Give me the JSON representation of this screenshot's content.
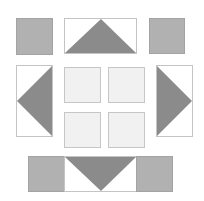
{
  "diagram": {
    "title": "",
    "colors": {
      "background": "#ffffff",
      "gray_square": "#b1b1b1",
      "triangle": "#8b8b8b",
      "light_square": "#f1f1f1",
      "border": "#c4c4c4"
    },
    "pieces": [
      {
        "id": "top-left-square",
        "type": "square",
        "fill": "gray"
      },
      {
        "id": "top-center-triangle-block",
        "type": "triangle-rect",
        "direction": "up"
      },
      {
        "id": "top-right-square",
        "type": "square",
        "fill": "gray"
      },
      {
        "id": "left-triangle-block",
        "type": "triangle-rect",
        "direction": "left"
      },
      {
        "id": "center-square-1",
        "type": "square",
        "fill": "light"
      },
      {
        "id": "center-square-2",
        "type": "square",
        "fill": "light"
      },
      {
        "id": "center-square-3",
        "type": "square",
        "fill": "light"
      },
      {
        "id": "center-square-4",
        "type": "square",
        "fill": "light"
      },
      {
        "id": "right-triangle-block",
        "type": "triangle-rect",
        "direction": "right"
      },
      {
        "id": "bottom-left-square",
        "type": "square",
        "fill": "gray"
      },
      {
        "id": "bottom-center-triangle-block",
        "type": "triangle-rect",
        "direction": "down"
      },
      {
        "id": "bottom-right-square",
        "type": "square",
        "fill": "gray"
      }
    ]
  }
}
